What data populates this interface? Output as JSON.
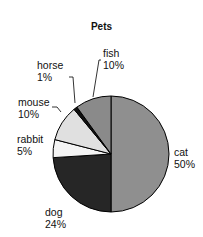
{
  "chart_data": {
    "type": "pie",
    "title": "Pets",
    "categories": [
      "cat",
      "dog",
      "rabbit",
      "mouse",
      "horse",
      "fish"
    ],
    "values": [
      50,
      24,
      5,
      10,
      1,
      10
    ],
    "value_labels": [
      "50%",
      "24%",
      "5%",
      "10%",
      "1%",
      "10%"
    ],
    "colors": [
      "#8f8f8f",
      "#262626",
      "#f4f4f4",
      "#e0e0e0",
      "#111111",
      "#8a8a8a"
    ],
    "start_angle_deg": 0,
    "direction": "clockwise",
    "legend": "none",
    "labels_outside": true
  },
  "labels": {
    "cat": {
      "name": "cat",
      "pct": "50%"
    },
    "dog": {
      "name": "dog",
      "pct": "24%"
    },
    "rabbit": {
      "name": "rabbit",
      "pct": "5%"
    },
    "mouse": {
      "name": "mouse",
      "pct": "10%"
    },
    "horse": {
      "name": "horse",
      "pct": "1%"
    },
    "fish": {
      "name": "fish",
      "pct": "10%"
    }
  }
}
